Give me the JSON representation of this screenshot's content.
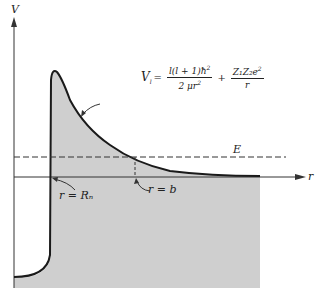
{
  "figure": {
    "type": "potential-energy-diagram",
    "axes": {
      "y_label": "V",
      "x_label": "r"
    },
    "curve_label": {
      "lhs": "V",
      "lhs_sub": "l",
      "equals": "=",
      "term1_num": "l(l + 1)ħ",
      "term1_num_sup": "2",
      "term1_den": "2 μr",
      "term1_den_sup": "2",
      "plus": "+",
      "term2_num": "Z₁Z₂e",
      "term2_num_sup": "2",
      "term2_den": "r"
    },
    "energy_label": "E",
    "annotations": {
      "nuclear_radius": "r = Rₙ",
      "turning_point": "r = b"
    },
    "colors": {
      "fill": "#cfcfcf",
      "line": "#1a1a1a",
      "background": "#ffffff"
    }
  }
}
